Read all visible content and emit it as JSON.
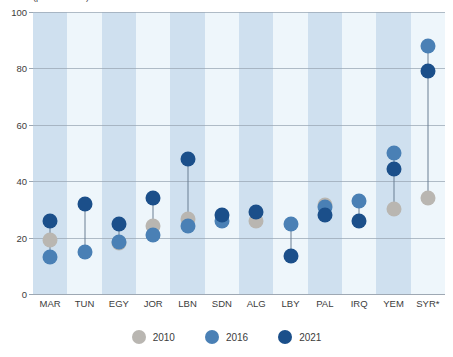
{
  "top_cropped_text": "(percent of ...)",
  "legend": {
    "position": "bottom-center",
    "entries": [
      {
        "label": "2010",
        "color": "#b9b6b1",
        "key": "2010"
      },
      {
        "label": "2016",
        "color": "#4a80b5",
        "key": "2016"
      },
      {
        "label": "2021",
        "color": "#1b4f8a",
        "key": "2021"
      }
    ]
  },
  "style": {
    "band_dark": "#cfe0ef",
    "band_light": "#eef6fb",
    "gridline": "#9aa7b4",
    "connector": "#6b7f93",
    "text": "#3c3c3c"
  },
  "chart_data": {
    "type": "scatter",
    "title": "",
    "subtitle": "",
    "xlabel": "",
    "ylabel": "",
    "ylim": [
      0,
      100
    ],
    "yticks": [
      0,
      20,
      40,
      60,
      80,
      100
    ],
    "grid": true,
    "categories": [
      "MAR",
      "TUN",
      "EGY",
      "JOR",
      "LBN",
      "SDN",
      "ALG",
      "LBY",
      "PAL",
      "IRQ",
      "YEM",
      "SYR*"
    ],
    "series": [
      {
        "name": "2010",
        "color": "#b9b6b1",
        "values": [
          19,
          null,
          18,
          24,
          26.5,
          null,
          26,
          null,
          31.5,
          null,
          30,
          34
        ]
      },
      {
        "name": "2016",
        "color": "#4a80b5",
        "values": [
          13,
          15,
          18.5,
          21,
          24,
          26,
          null,
          25,
          31,
          33,
          50,
          88
        ]
      },
      {
        "name": "2021",
        "color": "#1b4f8a",
        "values": [
          26,
          32,
          25,
          34,
          48,
          28,
          29,
          13.5,
          28,
          26,
          44.5,
          79
        ]
      }
    ]
  }
}
